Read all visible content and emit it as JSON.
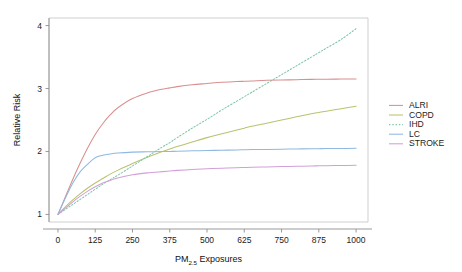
{
  "chart_data": {
    "type": "line",
    "title": "",
    "xlabel": "PM2.5 Exposures",
    "xlabel_main": "PM",
    "xlabel_sub": "2.5",
    "xlabel_tail": " Exposures",
    "ylabel": "Relative Risk",
    "xlim": [
      -30,
      1040
    ],
    "ylim": [
      0.88,
      4.12
    ],
    "xticks": [
      0,
      125,
      250,
      375,
      500,
      625,
      750,
      875,
      1000
    ],
    "xticklabels": [
      "0",
      "125",
      "250",
      "375",
      "500",
      "625",
      "750",
      "875",
      "1000"
    ],
    "yticks": [
      1,
      2,
      3,
      4
    ],
    "yticklabels": [
      "1",
      "2",
      "3",
      "4"
    ],
    "grid": false,
    "legend_position": "right",
    "x": [
      0,
      25,
      50,
      75,
      100,
      125,
      150,
      175,
      200,
      250,
      300,
      350,
      375,
      400,
      450,
      500,
      550,
      600,
      625,
      650,
      700,
      750,
      800,
      850,
      875,
      900,
      950,
      1000
    ],
    "series": [
      {
        "name": "ALRI",
        "color": "#d98f8f",
        "dash": "none",
        "values": [
          1.0,
          1.28,
          1.56,
          1.82,
          2.06,
          2.27,
          2.44,
          2.58,
          2.69,
          2.84,
          2.93,
          2.99,
          3.01,
          3.03,
          3.06,
          3.08,
          3.1,
          3.11,
          3.115,
          3.12,
          3.13,
          3.135,
          3.14,
          3.145,
          3.147,
          3.148,
          3.15,
          3.15
        ],
        "end_value": 3.15
      },
      {
        "name": "COPD",
        "color": "#b9c36e",
        "dash": "none",
        "values": [
          1.0,
          1.12,
          1.23,
          1.33,
          1.42,
          1.5,
          1.57,
          1.64,
          1.7,
          1.81,
          1.91,
          2.0,
          2.04,
          2.08,
          2.15,
          2.22,
          2.28,
          2.34,
          2.37,
          2.4,
          2.45,
          2.5,
          2.55,
          2.6,
          2.62,
          2.64,
          2.68,
          2.72
        ],
        "end_value": 2.72
      },
      {
        "name": "IHD",
        "color": "#7fc6a8",
        "dash": "1.4,1.9",
        "values": [
          1.0,
          1.08,
          1.16,
          1.24,
          1.32,
          1.4,
          1.48,
          1.55,
          1.62,
          1.77,
          1.92,
          2.07,
          2.14,
          2.22,
          2.37,
          2.51,
          2.66,
          2.8,
          2.87,
          2.94,
          3.08,
          3.22,
          3.36,
          3.5,
          3.57,
          3.64,
          3.78,
          3.95
        ],
        "end_value": 3.95
      },
      {
        "name": "LC",
        "color": "#8fb9e0",
        "dash": "none",
        "values": [
          1.0,
          1.26,
          1.5,
          1.68,
          1.8,
          1.9,
          1.94,
          1.96,
          1.975,
          1.99,
          1.995,
          2.0,
          2.0,
          2.005,
          2.01,
          2.015,
          2.02,
          2.025,
          2.028,
          2.03,
          2.033,
          2.037,
          2.04,
          2.043,
          2.045,
          2.046,
          2.048,
          2.05
        ],
        "end_value": 2.05
      },
      {
        "name": "STROKE",
        "color": "#d1a0d8",
        "dash": "none",
        "values": [
          1.0,
          1.1,
          1.2,
          1.29,
          1.37,
          1.44,
          1.5,
          1.54,
          1.58,
          1.63,
          1.66,
          1.68,
          1.69,
          1.7,
          1.715,
          1.725,
          1.735,
          1.742,
          1.745,
          1.748,
          1.755,
          1.76,
          1.765,
          1.77,
          1.772,
          1.774,
          1.777,
          1.78
        ],
        "end_value": 1.78
      }
    ],
    "legend_entries": [
      "ALRI",
      "COPD",
      "IHD",
      "LC",
      "STROKE"
    ]
  }
}
